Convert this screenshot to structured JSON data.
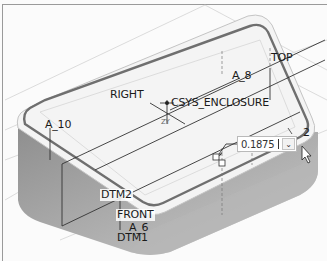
{
  "viewport": {
    "model": "enclosure-part",
    "background_color": "#fbfbfb",
    "datum_labels": {
      "top": "TOP",
      "right": "RIGHT",
      "csys": "CSYS_ENCLOSURE",
      "front": "FRONT",
      "dtm2": "DTM2",
      "dtm1": "DTM1"
    },
    "axis_labels": {
      "a8": "A_8",
      "a10": "A_10",
      "a6": "A_6"
    },
    "csys_axis_hint": "ZY",
    "dimension_marker": "2"
  },
  "dimension_editor": {
    "value": "0.1875",
    "dropdown_icon": "chevron-down-icon"
  },
  "cursor": {
    "icon": "arrow-cursor-icon"
  }
}
